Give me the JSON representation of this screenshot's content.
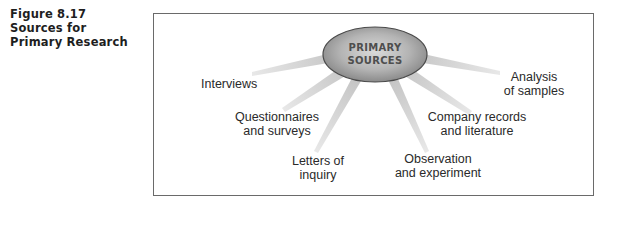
{
  "caption": {
    "lines": [
      "Figure 8.17",
      "Sources for",
      "Primary Research"
    ]
  },
  "hub": {
    "lines": [
      "PRIMARY",
      "SOURCES"
    ]
  },
  "nodes": [
    {
      "id": "interviews",
      "lines": [
        "Interviews"
      ]
    },
    {
      "id": "questionnaires",
      "lines": [
        "Questionnaires",
        "and surveys"
      ]
    },
    {
      "id": "letters",
      "lines": [
        "Letters of",
        "inquiry"
      ]
    },
    {
      "id": "observation",
      "lines": [
        "Observation",
        "and experiment"
      ]
    },
    {
      "id": "company-records",
      "lines": [
        "Company records",
        "and literature"
      ]
    },
    {
      "id": "analysis",
      "lines": [
        "Analysis",
        "of samples"
      ]
    }
  ],
  "colors": {
    "spoke": "#c4c4c4",
    "hub_center": "#d6d6d6",
    "hub_edge": "#8c8c8c",
    "hub_outline": "#4a4a4a",
    "frame": "#6a6a6a",
    "text": "#2a2a2a"
  }
}
